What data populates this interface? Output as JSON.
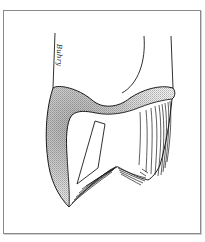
{
  "figure": {
    "signature_text": "Buhry",
    "colors": {
      "ink": "#1a1a1a",
      "frame": "#8a8a8a",
      "background": "#ffffff"
    }
  }
}
